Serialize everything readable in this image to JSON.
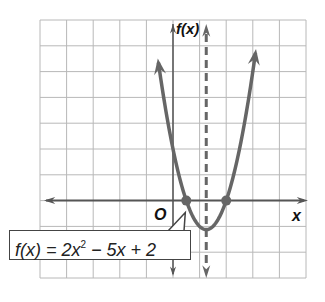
{
  "chart_data": {
    "type": "line",
    "title": "",
    "function": "f(x) = 2x^2 - 5x + 2",
    "coefficients": {
      "a": 2,
      "b": -5,
      "c": 2
    },
    "xlabel": "x",
    "ylabel": "f(x)",
    "origin_label": "O",
    "xlim": [
      -5,
      5
    ],
    "ylim": [
      -3,
      7
    ],
    "grid": true,
    "grid_step": 1,
    "axis_of_symmetry": 1.25,
    "vertex": [
      1.25,
      -1.125
    ],
    "roots": [
      0.5,
      2
    ],
    "y_intercept": 2,
    "marked_points": [
      [
        0.5,
        0
      ],
      [
        2,
        0
      ]
    ],
    "series": [
      {
        "name": "f(x) = 2x^2 - 5x + 2",
        "x_range": [
          -0.55,
          3.1
        ]
      }
    ],
    "callout": {
      "text_parts": [
        "f(x) = 2x",
        "2",
        " − 5x + 2"
      ],
      "points_to": [
        0.5,
        0
      ]
    }
  },
  "colors": {
    "grid": "#b8b8b8",
    "axis": "#555555",
    "curve": "#666666",
    "dashed": "#666666"
  }
}
